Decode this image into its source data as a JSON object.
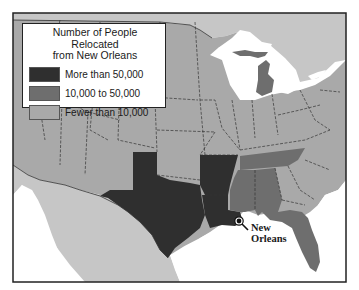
{
  "legend": {
    "title_line1": "Number of People Relocated",
    "title_line2": "from New Orleans",
    "items": [
      {
        "label": "More than 50,000",
        "color": "#2f2f2f"
      },
      {
        "label": "10,000 to 50,000",
        "color": "#6e6e6e"
      },
      {
        "label": "Fewer than 10,000",
        "color": "#a9a9a9"
      }
    ]
  },
  "city": {
    "name_line1": "New",
    "name_line2": "Orleans"
  },
  "colors": {
    "high": "#2f2f2f",
    "medium": "#6e6e6e",
    "low": "#a9a9a9",
    "foreign": "#c6c6c6",
    "water": "#ffffff",
    "border": "#222222"
  },
  "states": {
    "more_than_50000": [
      "Texas",
      "Arkansas",
      "Louisiana"
    ],
    "10000_to_50000": [
      "Tennessee",
      "Mississippi",
      "Alabama",
      "Florida",
      "Michigan"
    ],
    "fewer_than_10000": [
      "All other states"
    ]
  }
}
